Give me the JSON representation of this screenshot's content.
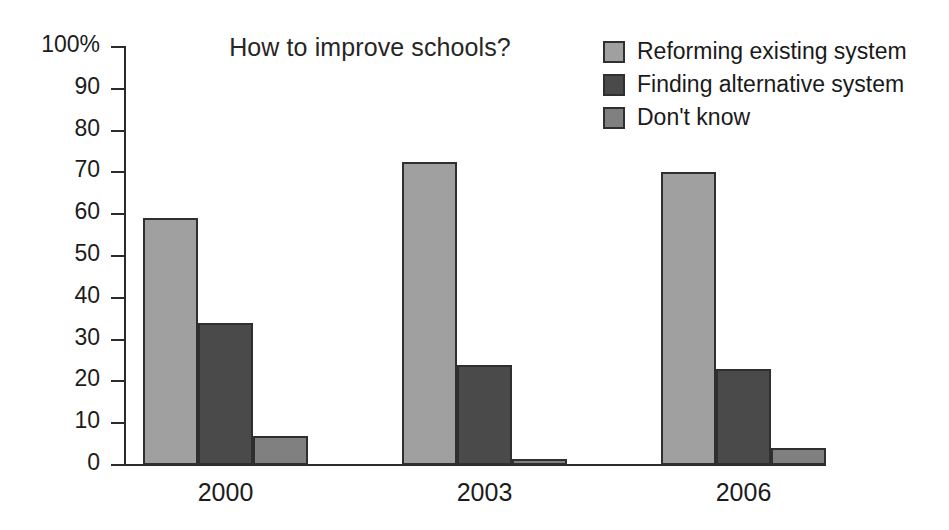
{
  "chart_data": {
    "type": "bar",
    "title": "How to improve schools?",
    "xlabel": "",
    "ylabel": "",
    "categories": [
      "2000",
      "2003",
      "2006"
    ],
    "series": [
      {
        "name": "Reforming existing system",
        "color": "#a0a0a0",
        "values": [
          59,
          72.5,
          70
        ]
      },
      {
        "name": "Finding alternative system",
        "color": "#4a4a4a",
        "values": [
          34,
          24,
          23
        ]
      },
      {
        "name": "Don't know",
        "color": "#808080",
        "values": [
          7,
          1.5,
          4
        ]
      }
    ],
    "ylim": [
      0,
      100
    ],
    "ytick_values": [
      0,
      10,
      20,
      30,
      40,
      50,
      60,
      70,
      80,
      90,
      100
    ],
    "ytick_labels": [
      "0",
      "10",
      "20",
      "30",
      "40",
      "50",
      "60",
      "70",
      "80",
      "90",
      "100%"
    ],
    "grid": false,
    "legend_position": "top-right",
    "axis_color": "#2b2b2b",
    "bar_outline_color": "#2f2f2f",
    "background": "#ffffff"
  },
  "legend": {
    "items": [
      {
        "label": "Reforming existing system",
        "color": "#a0a0a0"
      },
      {
        "label": "Finding alternative system",
        "color": "#4a4a4a"
      },
      {
        "label": "Don't know",
        "color": "#808080"
      }
    ]
  }
}
